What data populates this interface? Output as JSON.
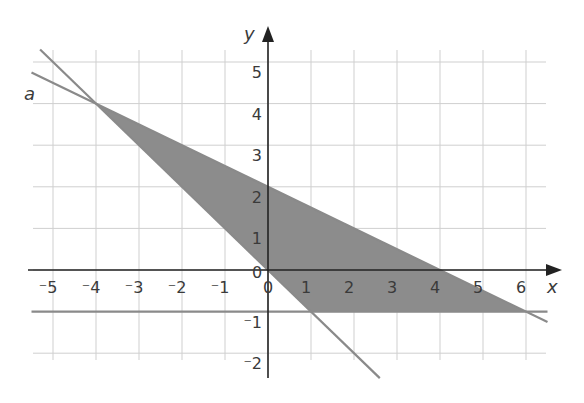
{
  "chart_data": {
    "type": "line",
    "title": "",
    "xlabel": "x",
    "ylabel": "y",
    "xlim": [
      -5.5,
      6.5
    ],
    "ylim": [
      -2.5,
      5.5
    ],
    "grid": true,
    "x_ticks": [
      "-5",
      "-4",
      "-3",
      "-2",
      "-1",
      "0",
      "1",
      "2",
      "3",
      "4",
      "5",
      "6"
    ],
    "y_ticks": [
      "-2",
      "-1",
      "0",
      "1",
      "2",
      "3",
      "4",
      "5"
    ],
    "origin_label": "0",
    "series": [
      {
        "name": "a",
        "equation": "y = -x/2 + 2",
        "points": [
          [
            -5.5,
            4.75
          ],
          [
            -4,
            4
          ],
          [
            0,
            2
          ],
          [
            4,
            0
          ],
          [
            6,
            -1
          ],
          [
            6.5,
            -1.25
          ]
        ]
      },
      {
        "name": "steep line",
        "equation": "y = -x",
        "points": [
          [
            -5.3,
            5.3
          ],
          [
            -4,
            4
          ],
          [
            0,
            0
          ],
          [
            1,
            -1
          ],
          [
            2,
            -2
          ],
          [
            2.6,
            -2.6
          ]
        ]
      },
      {
        "name": "horizontal line",
        "equation": "y = -1",
        "points": [
          [
            -5.5,
            -1
          ],
          [
            6.5,
            -1
          ]
        ]
      }
    ],
    "shaded_region": {
      "vertices": [
        [
          -4,
          4
        ],
        [
          6,
          -1
        ],
        [
          1,
          -1
        ]
      ],
      "color": "#8c8c8c"
    },
    "annotations": [
      {
        "text": "a",
        "x": -5.7,
        "y": 3.6
      }
    ]
  },
  "labels": {
    "x_axis": "x",
    "y_axis": "y",
    "line_a": "a",
    "origin": "0",
    "x_ticks": [
      "-5",
      "-4",
      "-3",
      "-2",
      "-1",
      "1",
      "2",
      "3",
      "4",
      "5",
      "6"
    ],
    "y_ticks_pos": [
      "1",
      "2",
      "3",
      "4",
      "5"
    ],
    "y_ticks_neg": [
      "-1",
      "-2"
    ]
  },
  "colors": {
    "grid": "#cfcfcf",
    "axes": "#222222",
    "lines": "#8a8a8a",
    "shade": "#8c8c8c"
  }
}
